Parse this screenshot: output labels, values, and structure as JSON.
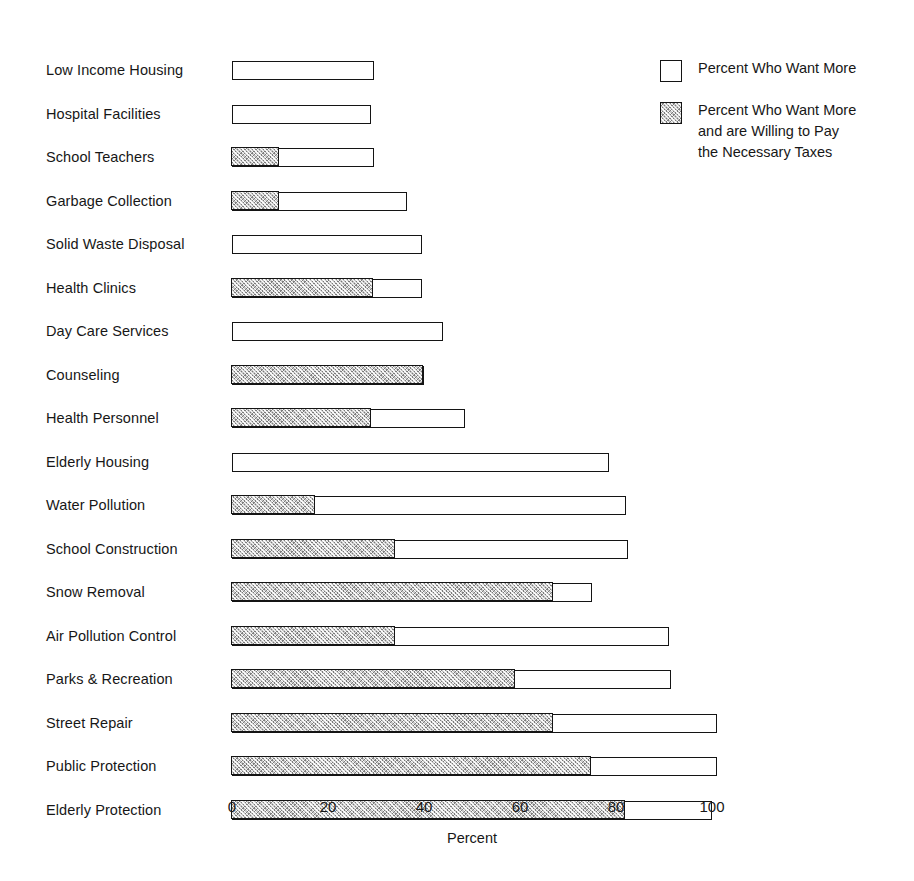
{
  "chart_data": {
    "type": "bar",
    "orientation": "horizontal",
    "stacked": true,
    "title": "",
    "xlabel": "Percent",
    "ylabel": "",
    "xlim": [
      0,
      100
    ],
    "xticks": [
      0,
      20,
      40,
      60,
      80,
      100
    ],
    "xtick_labels": [
      "0",
      "20",
      "40",
      "60",
      "80",
      "100"
    ],
    "grid": false,
    "legend_position": "top-right",
    "categories": [
      "Low Income Housing",
      "Hospital Facilities",
      "School Teachers",
      "Garbage Collection",
      "Solid Waste Disposal",
      "Health Clinics",
      "Day Care Services",
      "Counseling",
      "Health Personnel",
      "Elderly Housing",
      "Water Pollution",
      "School Construction",
      "Snow Removal",
      "Air Pollution Control",
      "Parks & Recreation",
      "Street Repair",
      "Public Protection",
      "Elderly Protection"
    ],
    "series": [
      {
        "name": "Percent Who Want More and are Willing to Pay the Necessary Taxes",
        "values": [
          0,
          0,
          10,
          10,
          0,
          29.5,
          0,
          40,
          29,
          0,
          17.5,
          34,
          67,
          34,
          59,
          67,
          75,
          82
        ]
      },
      {
        "name": "Percent Who Want More",
        "values": [
          29.5,
          29,
          29.5,
          36.5,
          39.5,
          39.5,
          44,
          40,
          48.5,
          78.5,
          82,
          82.5,
          75,
          91,
          91.5,
          101,
          101,
          100
        ]
      }
    ],
    "bars": [
      {
        "label": "Low Income Housing",
        "total": 29.5,
        "willing_to_pay": 0
      },
      {
        "label": "Hospital Facilities",
        "total": 29,
        "willing_to_pay": 0
      },
      {
        "label": "School Teachers",
        "total": 29.5,
        "willing_to_pay": 10
      },
      {
        "label": "Garbage Collection",
        "total": 36.5,
        "willing_to_pay": 10
      },
      {
        "label": "Solid Waste Disposal",
        "total": 39.5,
        "willing_to_pay": 0
      },
      {
        "label": "Health Clinics",
        "total": 39.5,
        "willing_to_pay": 29.5
      },
      {
        "label": "Day Care Services",
        "total": 44,
        "willing_to_pay": 0
      },
      {
        "label": "Counseling",
        "total": 40,
        "willing_to_pay": 40
      },
      {
        "label": "Health Personnel",
        "total": 48.5,
        "willing_to_pay": 29
      },
      {
        "label": "Elderly Housing",
        "total": 78.5,
        "willing_to_pay": 0
      },
      {
        "label": "Water Pollution",
        "total": 82,
        "willing_to_pay": 17.5
      },
      {
        "label": "School Construction",
        "total": 82.5,
        "willing_to_pay": 34
      },
      {
        "label": "Snow Removal",
        "total": 75,
        "willing_to_pay": 67
      },
      {
        "label": "Air Pollution Control",
        "total": 91,
        "willing_to_pay": 34
      },
      {
        "label": "Parks & Recreation",
        "total": 91.5,
        "willing_to_pay": 59
      },
      {
        "label": "Street Repair",
        "total": 101,
        "willing_to_pay": 67
      },
      {
        "label": "Public Protection",
        "total": 101,
        "willing_to_pay": 75
      },
      {
        "label": "Elderly Protection",
        "total": 100,
        "willing_to_pay": 82
      }
    ]
  },
  "legend": {
    "items": [
      {
        "swatch": "open",
        "label": "Percent Who Want More"
      },
      {
        "swatch": "hatched",
        "label": "Percent Who Want More\nand are Willing to Pay\nthe Necessary Taxes"
      }
    ]
  },
  "axis": {
    "title": "Percent",
    "ticks": [
      "0",
      "20",
      "40",
      "60",
      "80",
      "100"
    ]
  },
  "colors": {
    "bar_outline": "#141414",
    "bar_open_fill": "#ffffff",
    "bar_hatched_fill": "#c9c9c9",
    "text": "#171717",
    "background": "#ffffff"
  }
}
